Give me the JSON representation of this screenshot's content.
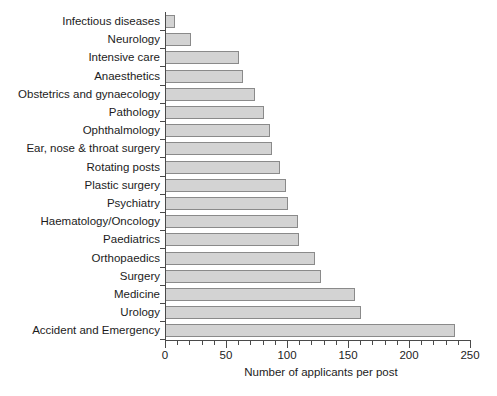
{
  "chart_data": {
    "type": "bar",
    "orientation": "horizontal",
    "title": "",
    "xlabel": "Number of applicants per post",
    "ylabel": "",
    "xlim": [
      0,
      250
    ],
    "x_major_ticks": [
      0,
      50,
      100,
      150,
      200,
      250
    ],
    "x_minor_tick_step": 10,
    "grid": false,
    "legend": false,
    "bar_fill_color": "#d3d3d3",
    "bar_edge_color": "#8a8a8a",
    "categories": [
      "Infectious diseases",
      "Neurology",
      "Intensive care",
      "Anaesthetics",
      "Obstetrics and gynaecology",
      "Pathology",
      "Ophthalmology",
      "Ear, nose & throat surgery",
      "Rotating posts",
      "Plastic surgery",
      "Psychiatry",
      "Haematology/Oncology",
      "Paediatrics",
      "Orthopaedics",
      "Surgery",
      "Medicine",
      "Urology",
      "Accident and Emergency"
    ],
    "values": [
      8,
      21,
      61,
      64,
      74,
      81,
      86,
      88,
      94,
      99,
      101,
      109,
      110,
      123,
      128,
      156,
      161,
      238
    ]
  }
}
